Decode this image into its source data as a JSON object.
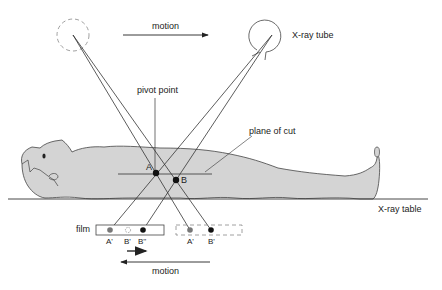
{
  "diagram": {
    "labels": {
      "motion_top": "motion",
      "xray_tube": "X-ray tube",
      "pivot_point": "pivot point",
      "plane_of_cut": "plane of cut",
      "xray_table": "X-ray table",
      "film": "film",
      "motion_bottom": "motion",
      "point_a": "A",
      "point_b": "B",
      "film_a_prime_left": "A'",
      "film_b_prime_left": "B'",
      "film_b_double_prime": "B''",
      "film_a_prime_right": "A'",
      "film_b_prime_right": "B'"
    },
    "colors": {
      "line": "#333333",
      "body_fill": "#d4d4d4",
      "point_black": "#111111",
      "point_gray": "#777777",
      "dashed": "#888888"
    }
  }
}
